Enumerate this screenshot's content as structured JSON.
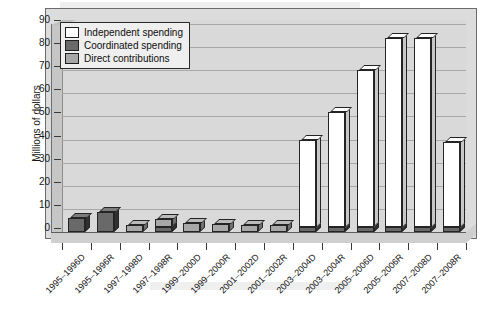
{
  "chart_data": {
    "type": "bar",
    "title": "",
    "subtitle": "",
    "xlabel": "",
    "ylabel": "Millions of dollars",
    "ylim": [
      0,
      90
    ],
    "yticks": [
      0,
      10,
      20,
      30,
      40,
      50,
      60,
      70,
      80,
      90
    ],
    "grid": true,
    "legend_position": "top-left",
    "stacked": true,
    "three_d": true,
    "categories": [
      "1995–1996D",
      "1995–1996R",
      "1997–1998D",
      "1997–1998R",
      "1999–2000D",
      "1999–2000R",
      "2001–2002D",
      "2001–2002R",
      "2003–2004D",
      "2003–2004R",
      "2005–2006D",
      "2005–2006R",
      "2007–2008D",
      "2007–2008R"
    ],
    "series": [
      {
        "name": "Independent spending",
        "color": "#ffffff",
        "values": [
          0,
          0,
          0,
          0,
          0,
          0,
          0,
          0,
          38,
          50,
          68,
          82,
          82,
          37
        ]
      },
      {
        "name": "Coordinated spending",
        "color": "#696969",
        "values": [
          6.0,
          8.5,
          0,
          2.0,
          0,
          0,
          0,
          0,
          2.0,
          2.0,
          2.0,
          2.0,
          2.0,
          2.0
        ]
      },
      {
        "name": "Direct contributions",
        "color": "#a8a8a8",
        "values": [
          0,
          0,
          3.0,
          3.5,
          4.0,
          3.5,
          3.0,
          3.0,
          0,
          0,
          0,
          0,
          0,
          0
        ]
      }
    ]
  },
  "legend": {
    "items": [
      {
        "label": "Independent spending",
        "swatch": "#ffffff"
      },
      {
        "label": "Coordinated spending",
        "swatch": "#696969"
      },
      {
        "label": "Direct contributions",
        "swatch": "#a8a8a8"
      }
    ]
  },
  "axis": {
    "y_title": "Millions of dollars",
    "y_tick_labels": [
      "90",
      "80",
      "70",
      "60",
      "50",
      "40",
      "30",
      "20",
      "10",
      "0"
    ]
  },
  "colors": {
    "plot_background": "#d9d9d9",
    "figure_background": "#dcdcdc",
    "gridline": "#a8a8a8",
    "axis_line": "#3a3a3a",
    "independent": "#ffffff",
    "coordinated": "#696969",
    "direct": "#a8a8a8"
  }
}
